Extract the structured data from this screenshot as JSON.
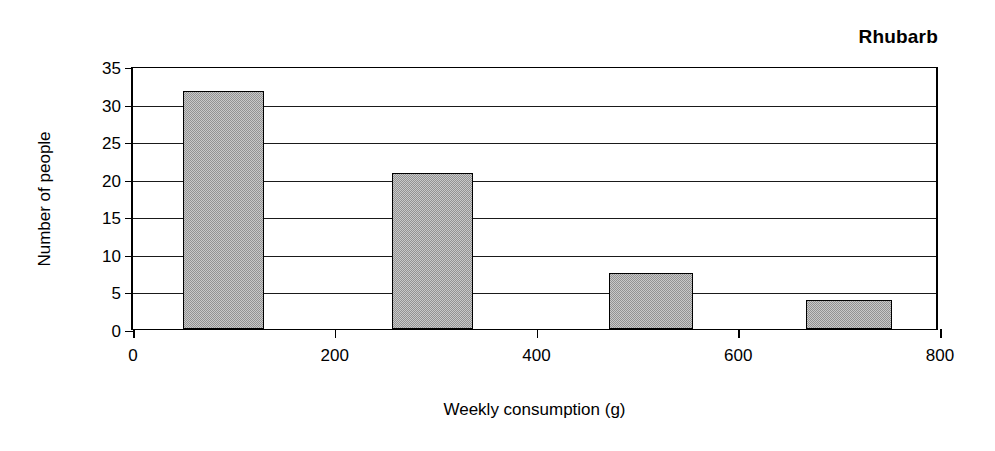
{
  "chart_data": {
    "type": "bar",
    "title": "Rhubarb",
    "xlabel": "Weekly consumption (g)",
    "ylabel": "Number of people",
    "xlim": [
      0,
      800
    ],
    "ylim": [
      0,
      35
    ],
    "xticks": [
      0,
      200,
      400,
      600,
      800
    ],
    "yticks": [
      0,
      5,
      10,
      15,
      20,
      25,
      30,
      35
    ],
    "xtick_labels": [
      "0",
      "200",
      "400",
      "600",
      "800"
    ],
    "ytick_labels": [
      "0",
      "5",
      "10",
      "15",
      "20",
      "25",
      "30",
      "35"
    ],
    "grid": "horizontal",
    "legend": "none",
    "bar_color": "#a3a3a3",
    "bar_edge_color": "#000000",
    "background_color": "#ffffff",
    "bars": [
      {
        "label": "50-130",
        "x_start": 50,
        "x_end": 130,
        "value": 31.7
      },
      {
        "label": "257-337",
        "x_start": 257,
        "x_end": 337,
        "value": 20.8
      },
      {
        "label": "472-555",
        "x_start": 472,
        "x_end": 555,
        "value": 7.4
      },
      {
        "label": "667-752",
        "x_start": 667,
        "x_end": 752,
        "value": 3.8
      }
    ],
    "categories": [
      "50-130",
      "257-337",
      "472-555",
      "667-752"
    ],
    "values": [
      31.7,
      20.8,
      7.4,
      3.8
    ]
  }
}
